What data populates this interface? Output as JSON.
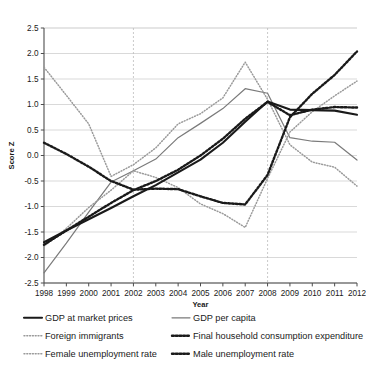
{
  "chart_data": {
    "type": "line",
    "title": "",
    "xlabel": "Year",
    "ylabel": "Score Z",
    "xlim": [
      1998,
      2012
    ],
    "ylim": [
      -2.5,
      2.5
    ],
    "grid": true,
    "legend_position": "bottom",
    "x": [
      1998,
      1999,
      2000,
      2001,
      2002,
      2003,
      2004,
      2005,
      2006,
      2007,
      2008,
      2009,
      2010,
      2011,
      2012
    ],
    "xtick_labels": [
      "1998",
      "1999",
      "2000",
      "2001",
      "2002",
      "2003",
      "2004",
      "2005",
      "2006",
      "2007",
      "2008",
      "2009",
      "2010",
      "2011",
      "2012"
    ],
    "ytick_labels": [
      "2.5",
      "2.0",
      "1.5",
      "1.0",
      "0.5",
      "0.0",
      "-0.5",
      "-1.0",
      "-1.5",
      "-2.0",
      "-2.5"
    ],
    "ytick_values": [
      2.5,
      2.0,
      1.5,
      1.0,
      0.5,
      0.0,
      -0.5,
      -1.0,
      -1.5,
      -2.0,
      -2.5
    ],
    "reference_lines": [
      2002,
      2008
    ],
    "series": [
      {
        "name": "GDP at market prices",
        "style": "solid",
        "color": "#1a1a1a",
        "width": 2.1,
        "values": [
          -1.7,
          -1.47,
          -1.25,
          -1.03,
          -0.8,
          -0.58,
          -0.33,
          -0.08,
          0.25,
          0.66,
          1.06,
          0.9,
          0.89,
          0.88,
          0.8
        ]
      },
      {
        "name": "GDP per capita",
        "style": "solid",
        "color": "#7a7a7a",
        "width": 1.2,
        "values": [
          -2.3,
          -1.72,
          -1.11,
          -0.52,
          -0.3,
          -0.07,
          0.35,
          0.63,
          0.92,
          1.31,
          1.22,
          0.35,
          0.28,
          0.26,
          -0.09
        ]
      },
      {
        "name": "Foreign immigrants",
        "style": "dotted-fine",
        "color": "#9a9a9a",
        "width": 1.5,
        "values": [
          1.73,
          1.18,
          0.62,
          -0.41,
          -0.18,
          0.15,
          0.62,
          0.82,
          1.13,
          1.83,
          1.1,
          0.21,
          -0.13,
          -0.23,
          -0.6
        ]
      },
      {
        "name": "Final household consumption expenditure",
        "style": "dotted-bold",
        "color": "#1a1a1a",
        "width": 2.4,
        "values": [
          -1.75,
          -1.47,
          -1.2,
          -0.93,
          -0.68,
          -0.5,
          -0.28,
          0.0,
          0.33,
          0.72,
          1.05,
          0.79,
          0.9,
          0.95,
          0.94
        ]
      },
      {
        "name": "Female unemployment rate",
        "style": "dotted-fine",
        "color": "#9a9a9a",
        "width": 1.5,
        "values": [
          -1.78,
          -1.43,
          -1.02,
          -0.68,
          -0.3,
          -0.43,
          -0.63,
          -0.95,
          -1.14,
          -1.41,
          -0.45,
          0.46,
          0.86,
          1.17,
          1.46
        ]
      },
      {
        "name": "Male unemployment rate",
        "style": "dotted-bold",
        "color": "#1a1a1a",
        "width": 2.4,
        "values": [
          0.25,
          0.03,
          -0.22,
          -0.5,
          -0.67,
          -0.65,
          -0.66,
          -0.8,
          -0.93,
          -0.96,
          -0.38,
          0.75,
          1.21,
          1.58,
          2.04
        ]
      }
    ]
  },
  "legend": {
    "entries": [
      {
        "label": "GDP at market prices"
      },
      {
        "label": "GDP per capita"
      },
      {
        "label": "Foreign immigrants"
      },
      {
        "label": "Final household consumption expenditure"
      },
      {
        "label": "Female unemployment rate"
      },
      {
        "label": "Male unemployment rate"
      }
    ]
  }
}
